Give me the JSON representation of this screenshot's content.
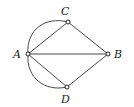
{
  "diagram": {
    "type": "graph",
    "nodes": [
      {
        "id": "A",
        "label": "A",
        "x": 28,
        "y": 54
      },
      {
        "id": "B",
        "label": "B",
        "x": 108,
        "y": 54
      },
      {
        "id": "C",
        "label": "C",
        "x": 68,
        "y": 22
      },
      {
        "id": "D",
        "label": "D",
        "x": 67,
        "y": 87
      }
    ],
    "edges": [
      {
        "from": "A",
        "to": "C",
        "style": "straight"
      },
      {
        "from": "A",
        "to": "C",
        "style": "curved"
      },
      {
        "from": "A",
        "to": "D",
        "style": "straight"
      },
      {
        "from": "A",
        "to": "D",
        "style": "curved"
      },
      {
        "from": "A",
        "to": "B",
        "style": "straight"
      },
      {
        "from": "C",
        "to": "B",
        "style": "straight"
      },
      {
        "from": "D",
        "to": "B",
        "style": "straight"
      }
    ]
  }
}
